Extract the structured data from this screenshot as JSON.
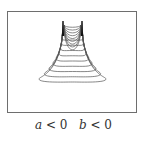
{
  "figure": {
    "caption": {
      "a_var": "a",
      "a_cond": " < 0   ",
      "b_var": "b",
      "b_cond": " < 0"
    },
    "contours": {
      "count": 9,
      "line_color": "#555555",
      "peak_color": "#111111",
      "peaks_x": [
        63,
        82
      ],
      "peak_top_y": 21
    }
  }
}
